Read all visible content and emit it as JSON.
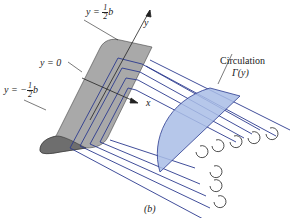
{
  "labels": {
    "y_top": {
      "prefix": "y = ",
      "num": "1",
      "den": "2",
      "suffix": "b"
    },
    "y_zero": "y = 0",
    "y_bottom": {
      "prefix": "y = −",
      "num": "1",
      "den": "2",
      "suffix": "b"
    },
    "y_axis": "y",
    "x_axis": "x",
    "circulation_title": "Circulation",
    "circulation_func": "Γ(y)",
    "caption": "(b)"
  },
  "colors": {
    "wing_fill": "#a9a9a9",
    "wing_dark": "#6e6e6e",
    "vortex_line": "#2b3a8f",
    "circulation_fill": "#a9bde6",
    "text": "#222222"
  }
}
